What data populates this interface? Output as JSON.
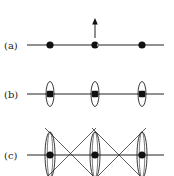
{
  "diagram": {
    "rows": [
      {
        "id": "a",
        "label": "(a)",
        "y": 45,
        "line": {
          "x1": 27,
          "x2": 164
        },
        "nodes": [
          {
            "x": 50,
            "shape": "dot"
          },
          {
            "x": 95,
            "shape": "crescent-dot"
          },
          {
            "x": 142,
            "shape": "dot"
          }
        ],
        "arrow": {
          "x": 95,
          "y_start": 38,
          "y_end": 20,
          "direction": "up"
        }
      },
      {
        "id": "b",
        "label": "(b)",
        "y": 94,
        "line": {
          "x1": 27,
          "x2": 164
        },
        "nodes": [
          {
            "x": 50,
            "shape": "square-dot",
            "ellipse": {
              "rx": 4,
              "ry": 12
            }
          },
          {
            "x": 95,
            "shape": "square-dot",
            "ellipse": {
              "rx": 4,
              "ry": 12
            }
          },
          {
            "x": 142,
            "shape": "square-dot",
            "ellipse": {
              "rx": 4,
              "ry": 12
            }
          }
        ]
      },
      {
        "id": "c",
        "label": "(c)",
        "y": 155,
        "line": {
          "x1": 27,
          "x2": 164
        },
        "nodes": [
          {
            "x": 50,
            "shape": "dot",
            "ellipse": {
              "rx": 5,
              "ry": 23
            }
          },
          {
            "x": 95,
            "shape": "dot",
            "ellipse": {
              "rx": 5,
              "ry": 23
            }
          },
          {
            "x": 142,
            "shape": "dot",
            "ellipse": {
              "rx": 5,
              "ry": 23
            }
          }
        ],
        "cross_lines": [
          {
            "x1": 45,
            "y1": 128,
            "x2": 97,
            "y2": 180
          },
          {
            "x1": 96,
            "y1": 128,
            "x2": 44,
            "y2": 180
          },
          {
            "x1": 92,
            "y1": 128,
            "x2": 144,
            "y2": 180
          },
          {
            "x1": 146,
            "y1": 128,
            "x2": 94,
            "y2": 180
          }
        ]
      }
    ],
    "colors": {
      "stroke": "#222222",
      "fill": "#111111",
      "background": "#ffffff"
    }
  }
}
